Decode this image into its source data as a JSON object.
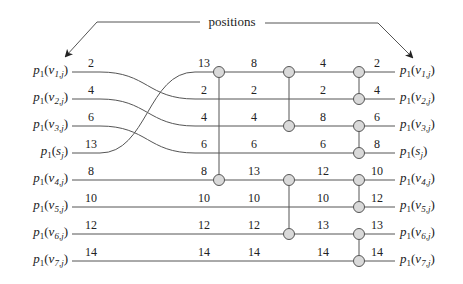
{
  "title": "positions",
  "colors": {
    "wire": "#555555",
    "comparator_fill": "#d9d9d9",
    "comparator_stroke": "#555555",
    "text": "#222222"
  },
  "rows_y": [
    72,
    99,
    126,
    153,
    180,
    207,
    234,
    261
  ],
  "left_labels": [
    {
      "base": "p",
      "sub1": "1",
      "arg": "v",
      "argsub": "1,j"
    },
    {
      "base": "p",
      "sub1": "1",
      "arg": "v",
      "argsub": "2,j"
    },
    {
      "base": "p",
      "sub1": "1",
      "arg": "v",
      "argsub": "3,j"
    },
    {
      "base": "p",
      "sub1": "1",
      "arg": "s",
      "argsub": "j"
    },
    {
      "base": "p",
      "sub1": "1",
      "arg": "v",
      "argsub": "4,j"
    },
    {
      "base": "p",
      "sub1": "1",
      "arg": "v",
      "argsub": "5,j"
    },
    {
      "base": "p",
      "sub1": "1",
      "arg": "v",
      "argsub": "6,j"
    },
    {
      "base": "p",
      "sub1": "1",
      "arg": "v",
      "argsub": "7,j"
    }
  ],
  "right_labels": [
    {
      "base": "p",
      "sub1": "1",
      "arg": "v",
      "argsub": "1,j"
    },
    {
      "base": "p",
      "sub1": "1",
      "arg": "v",
      "argsub": "2,j"
    },
    {
      "base": "p",
      "sub1": "1",
      "arg": "v",
      "argsub": "3,j"
    },
    {
      "base": "p",
      "sub1": "1",
      "arg": "s",
      "argsub": "j"
    },
    {
      "base": "p",
      "sub1": "1",
      "arg": "v",
      "argsub": "4,j"
    },
    {
      "base": "p",
      "sub1": "1",
      "arg": "v",
      "argsub": "5,j"
    },
    {
      "base": "p",
      "sub1": "1",
      "arg": "v",
      "argsub": "6,j"
    },
    {
      "base": "p",
      "sub1": "1",
      "arg": "v",
      "argsub": "7,j"
    }
  ],
  "columns": [
    {
      "x": 91,
      "values": [
        "2",
        "4",
        "6",
        "13",
        "8",
        "10",
        "12",
        "14"
      ]
    },
    {
      "x": 204,
      "values": [
        "13",
        "2",
        "4",
        "6",
        "8",
        "10",
        "12",
        "14"
      ]
    },
    {
      "x": 254,
      "values": [
        "8",
        "2",
        "4",
        "6",
        "13",
        "10",
        "12",
        "14"
      ]
    },
    {
      "x": 323,
      "values": [
        "4",
        "2",
        "8",
        "6",
        "12",
        "10",
        "13",
        "14"
      ]
    },
    {
      "x": 377,
      "values": [
        "2",
        "4",
        "6",
        "8",
        "10",
        "12",
        "13",
        "14"
      ]
    }
  ],
  "crossing": {
    "from_rows": [
      0,
      1,
      2,
      3
    ],
    "to_rows": [
      1,
      2,
      3,
      0
    ],
    "x_start": 100,
    "x_end": 195
  },
  "comparators": [
    {
      "x": 219,
      "top": 0,
      "bottom": 4
    },
    {
      "x": 289,
      "top": 0,
      "bottom": 2
    },
    {
      "x": 289,
      "top": 4,
      "bottom": 6
    },
    {
      "x": 359,
      "top": 0,
      "bottom": 1
    },
    {
      "x": 359,
      "top": 2,
      "bottom": 3
    },
    {
      "x": 359,
      "top": 4,
      "bottom": 5
    },
    {
      "x": 359,
      "top": 6,
      "bottom": 7
    }
  ]
}
